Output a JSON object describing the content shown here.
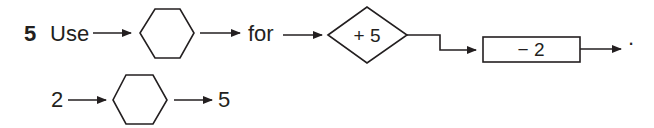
{
  "problem": {
    "number": "5",
    "line1": {
      "word_use": "Use",
      "word_for": "for",
      "diamond_label": "+ 5",
      "rect_label": "− 2",
      "end_punct": "."
    },
    "line2": {
      "input": "2",
      "output": "5"
    }
  },
  "colors": {
    "stroke": "#231f20",
    "background": "#ffffff"
  }
}
